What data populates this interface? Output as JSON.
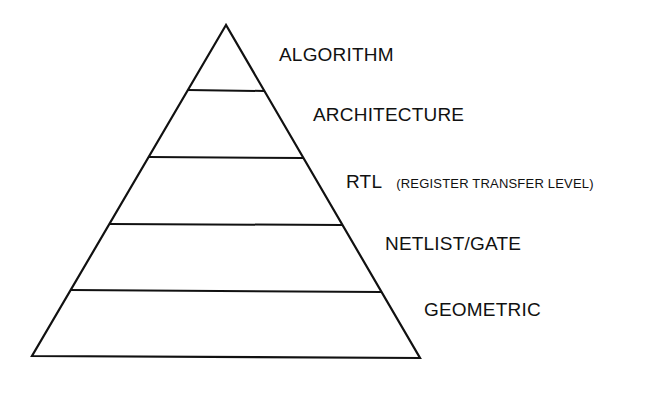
{
  "diagram": {
    "type": "pyramid",
    "levels": [
      {
        "label": "ALGORITHM",
        "note": ""
      },
      {
        "label": "ARCHITECTURE",
        "note": ""
      },
      {
        "label": "RTL",
        "note": "(REGISTER TRANSFER LEVEL)"
      },
      {
        "label": "NETLIST/GATE",
        "note": ""
      },
      {
        "label": "GEOMETRIC",
        "note": ""
      }
    ],
    "line_color": "#111111"
  }
}
